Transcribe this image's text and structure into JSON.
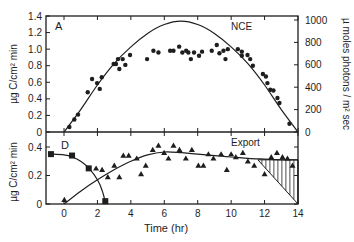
{
  "chart_data": [
    {
      "panel": "A",
      "type": "scatter",
      "label": "A",
      "series_label": "NCE",
      "xlabel": "",
      "ylabel": "µg C/cm² min",
      "ylabel_right": "µ moles photons / m² sec",
      "xlim": [
        -1,
        14
      ],
      "ylim": [
        0,
        1.4
      ],
      "ylim_right": [
        0,
        1000
      ],
      "yticks": [
        0,
        0.2,
        0.4,
        0.6,
        0.8,
        1.0,
        1.2,
        1.4
      ],
      "ytick_labels": [
        "0",
        "0.2",
        "0.4",
        "0.6",
        "0.8",
        "1.0",
        "1.2",
        "1.4"
      ],
      "yticks_right": [
        0,
        200,
        400,
        600,
        800,
        1000
      ],
      "ytick_labels_right": [
        "0",
        "200",
        "400",
        "600",
        "800",
        "1000"
      ],
      "grid": false,
      "series": [
        {
          "name": "NCE",
          "marker": "circle",
          "x": [
            0.32,
            0.62,
            0.84,
            1.42,
            1.68,
            1.98,
            2.14,
            2.26,
            2.97,
            3.11,
            3.23,
            3.31,
            3.51,
            3.67,
            3.95,
            4.97,
            5.35,
            5.65,
            6.35,
            6.55,
            6.89,
            7.08,
            7.31,
            7.44,
            7.59,
            7.78,
            8.08,
            8.26,
            8.84,
            9.14,
            9.3,
            9.54,
            9.66,
            9.8,
            10.4,
            10.64,
            10.64,
            10.98,
            11.14,
            11.3,
            11.9,
            12.08,
            12.17,
            12.34,
            12.53,
            12.77,
            12.89,
            13.49
          ],
          "y": [
            0.06,
            0.15,
            0.21,
            0.48,
            0.64,
            0.59,
            0.52,
            0.66,
            0.82,
            0.82,
            0.88,
            0.76,
            0.88,
            0.81,
            0.93,
            0.88,
            0.98,
            0.96,
            0.98,
            0.98,
            1.03,
            0.96,
            0.98,
            0.96,
            0.88,
            0.96,
            0.92,
            0.97,
            0.98,
            1.05,
            0.95,
            0.98,
            0.88,
            1.0,
            1.0,
            0.97,
            0.92,
            0.93,
            0.88,
            0.8,
            0.7,
            0.67,
            0.59,
            0.51,
            0.5,
            0.41,
            0.35,
            0.1
          ]
        },
        {
          "name": "Irradiance (light curve)",
          "marker": "line",
          "axis": "right",
          "x": [
            0,
            1,
            2,
            3,
            4,
            5,
            6,
            7,
            8,
            9,
            10,
            11,
            12,
            13,
            14
          ],
          "y": [
            0,
            200,
            420,
            610,
            760,
            880,
            960,
            990,
            960,
            880,
            760,
            610,
            420,
            200,
            0
          ]
        }
      ]
    },
    {
      "panel": "D",
      "type": "scatter",
      "label": "D",
      "series_label": "Export",
      "xlabel": "Time (hr)",
      "ylabel": "µg C/cm² min",
      "xlim": [
        -1,
        14
      ],
      "ylim": [
        0,
        0.45
      ],
      "xticks": [
        0,
        2,
        4,
        6,
        8,
        10,
        12,
        14
      ],
      "xtick_labels": [
        "0",
        "2",
        "4",
        "6",
        "8",
        "10",
        "12",
        "14"
      ],
      "yticks": [
        0,
        0.2,
        0.4
      ],
      "ytick_labels": [
        "0",
        "0.2",
        "0.4"
      ],
      "grid": false,
      "series": [
        {
          "name": "Export",
          "marker": "triangle",
          "x": [
            0.02,
            1.92,
            2.28,
            2.62,
            3.01,
            3.31,
            3.55,
            3.87,
            4.35,
            4.61,
            4.89,
            5.31,
            5.65,
            5.99,
            6.25,
            6.55,
            6.91,
            7.29,
            7.65,
            8.04,
            8.34,
            8.64,
            8.94,
            9.4,
            9.74,
            10.0,
            10.28,
            10.7,
            11.0,
            11.38,
            12.0,
            12.4,
            12.74,
            13.07,
            13.37,
            13.67
          ],
          "y": [
            0.03,
            0.25,
            0.24,
            0.19,
            0.27,
            0.19,
            0.34,
            0.34,
            0.32,
            0.21,
            0.27,
            0.38,
            0.41,
            0.36,
            0.32,
            0.41,
            0.38,
            0.32,
            0.38,
            0.27,
            0.27,
            0.35,
            0.32,
            0.35,
            0.24,
            0.35,
            0.33,
            0.36,
            0.3,
            0.27,
            0.21,
            0.33,
            0.36,
            0.33,
            0.32,
            0.27
          ]
        },
        {
          "name": "Export fit",
          "marker": "line",
          "x": [
            0,
            1,
            2,
            3,
            4,
            5,
            6,
            7,
            8,
            9,
            10,
            11,
            12,
            13,
            14
          ],
          "y": [
            0,
            0.09,
            0.17,
            0.24,
            0.3,
            0.345,
            0.365,
            0.36,
            0.35,
            0.34,
            0.33,
            0.32,
            0.315,
            0.31,
            0.31
          ]
        },
        {
          "name": "Storage (squares)",
          "marker": "square",
          "x": [
            -0.78,
            0.48,
            1.48,
            2.47
          ],
          "y": [
            0.35,
            0.34,
            0.25,
            0.02
          ]
        },
        {
          "name": "Storage fit",
          "marker": "line",
          "x": [
            -0.78,
            0,
            0.5,
            1.0,
            1.5,
            2.0,
            2.3,
            2.5
          ],
          "y": [
            0.35,
            0.345,
            0.33,
            0.3,
            0.25,
            0.17,
            0.09,
            0.0
          ]
        },
        {
          "name": "Hatched deficit region",
          "marker": "hatch",
          "x": [
            11.6,
            14,
            14
          ],
          "y": [
            0.31,
            0.31,
            0.0
          ]
        }
      ]
    }
  ],
  "labels": {
    "panel_a": "A",
    "panel_d": "D",
    "nce": "NCE",
    "export": "Export",
    "xlabel": "Time (hr)",
    "ylabel_top": "µg C/cm² min",
    "ylabel_bottom": "µg C/cm² min",
    "ylabel_right": "µ moles photons / m² sec"
  }
}
